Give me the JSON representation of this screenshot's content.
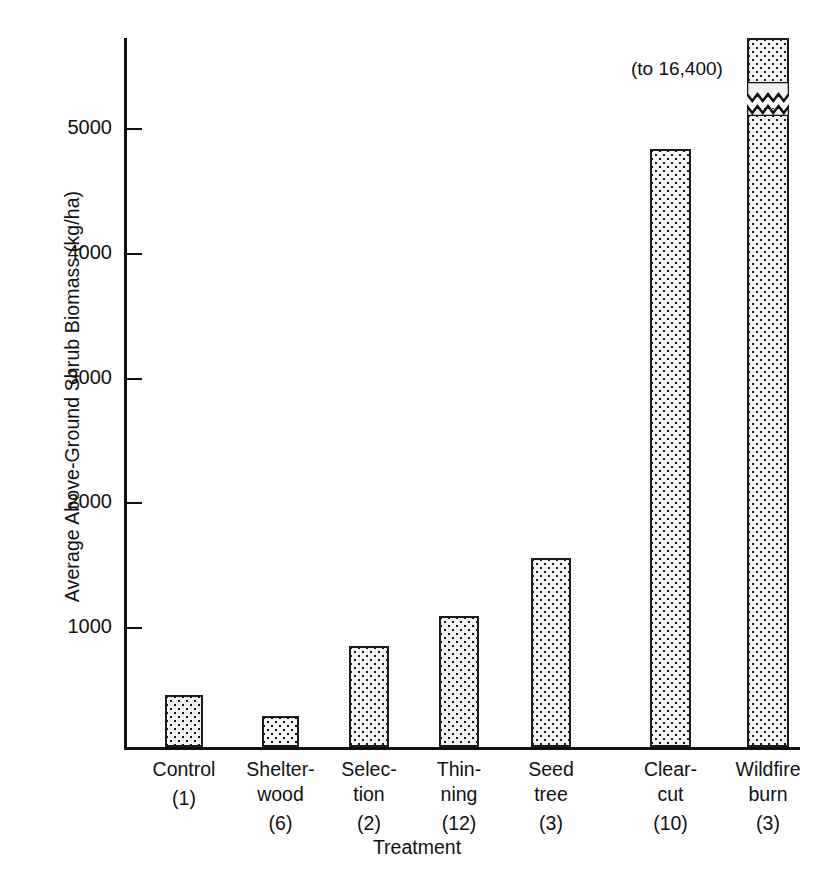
{
  "chart_data": {
    "type": "bar",
    "title": "",
    "xlabel": "Treatment",
    "ylabel": "Average Above-Ground Shrub Biomass (kg/ha)",
    "categories": [
      "Control",
      "Shelterwood",
      "Selection",
      "Thinning",
      "Seed tree",
      "Clearcut",
      "Wildfire burn"
    ],
    "values": [
      420,
      250,
      810,
      1050,
      1520,
      4800,
      16400
    ],
    "sample_sizes": [
      1,
      6,
      2,
      12,
      3,
      10,
      3
    ],
    "ytick_values": [
      1000,
      2000,
      3000,
      4000,
      5000
    ],
    "ytick_labels": [
      "1000",
      "2000",
      "3000",
      "4000",
      "5000"
    ],
    "ylim": [
      0,
      5800
    ],
    "grid": false,
    "legend": false,
    "axis_break": {
      "series_index": 6,
      "annotation": "(to 16,400)",
      "note": "Wildfire burn bar is truncated with a zigzag break; true value 16,400 kg/ha"
    }
  },
  "axes": {
    "y_title": "Average Above-Ground Shrub Biomass (kg/ha)",
    "x_title": "Treatment",
    "y_ticks": [
      {
        "label": "5000",
        "value": 5000
      },
      {
        "label": "4000",
        "value": 4000
      },
      {
        "label": "3000",
        "value": 3000
      },
      {
        "label": "2000",
        "value": 2000
      },
      {
        "label": "1000",
        "value": 1000
      }
    ]
  },
  "bars": [
    {
      "key": "control",
      "line1": "Control",
      "line2": "",
      "count": "(1)"
    },
    {
      "key": "shelterwood",
      "line1": "Shelter-",
      "line2": "wood",
      "count": "(6)"
    },
    {
      "key": "selection",
      "line1": "Selec-",
      "line2": "tion",
      "count": "(2)"
    },
    {
      "key": "thinning",
      "line1": "Thin-",
      "line2": "ning",
      "count": "(12)"
    },
    {
      "key": "seedtree",
      "line1": "Seed",
      "line2": "tree",
      "count": "(3)"
    },
    {
      "key": "clearcut",
      "line1": "Clear-",
      "line2": "cut",
      "count": "(10)"
    },
    {
      "key": "wildfire",
      "line1": "Wildfire",
      "line2": "burn",
      "count": "(3)"
    }
  ],
  "annotations": {
    "break_label": "(to 16,400)"
  },
  "colors": {
    "ink": "#111111",
    "bar_fill": "#f2f2f2",
    "bar_dot": "#151515",
    "background": "#ffffff"
  }
}
